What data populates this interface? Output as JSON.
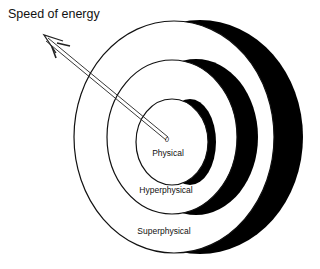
{
  "title": "Speed of energy",
  "origin_label": "0",
  "rings": [
    {
      "name": "Physical",
      "label": "Physical"
    },
    {
      "name": "Hyperphysical",
      "label": "Hyperphysical"
    },
    {
      "name": "Superphysical",
      "label": "Superphysical"
    }
  ],
  "colors": {
    "fill": "#000000",
    "background": "#ffffff",
    "stroke": "#111111"
  }
}
